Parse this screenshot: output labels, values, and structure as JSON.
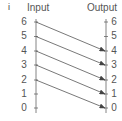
{
  "panel_label": "i",
  "input_axis": {
    "title": "Input",
    "ticks": [
      "6",
      "5",
      "4",
      "3",
      "2",
      "1",
      "0"
    ]
  },
  "output_axis": {
    "title": "Output",
    "ticks": [
      "6",
      "5",
      "4",
      "3",
      "2",
      "1",
      "0"
    ]
  },
  "mappings": [
    {
      "from": 6,
      "to": 4
    },
    {
      "from": 5,
      "to": 3
    },
    {
      "from": 4,
      "to": 2
    },
    {
      "from": 3,
      "to": 1
    },
    {
      "from": 2,
      "to": 0
    }
  ],
  "colors": {
    "axis": "#666666",
    "arrow": "#555555",
    "text": "#555555"
  }
}
